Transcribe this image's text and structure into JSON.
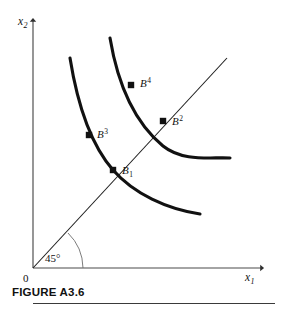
{
  "figure": {
    "caption": "FIGURE A3.6",
    "background_color": "#ffffff",
    "ink_color": "#111111"
  },
  "axes": {
    "y_label_base": "x",
    "y_label_sub": "2",
    "x_label_base": "x",
    "x_label_sub": "1",
    "origin_label": "0",
    "angle_label": "45°",
    "x_axis": {
      "x1": 33,
      "y1": 268,
      "x2": 262,
      "y2": 268
    },
    "y_axis": {
      "x1": 33,
      "y1": 268,
      "x2": 33,
      "y2": 20
    }
  },
  "ray45": {
    "name": "45-degree-ray",
    "x1": 33,
    "y1": 268,
    "x2": 227,
    "y2": 58,
    "angle_degrees": 45
  },
  "curves": [
    {
      "name": "lower-indifference-curve",
      "path": "M 70,58 C 78,108 92,146 113,170 C 134,194 167,209 200,214",
      "stroke_width": 3.1
    },
    {
      "name": "upper-indifference-curve",
      "path": "M 110,38 C 118,86 134,122 163,146 C 183,162 210,157 230,158",
      "stroke_width": 3.1
    }
  ],
  "points": [
    {
      "name": "point-B1",
      "label_base": "B",
      "label_script": "1",
      "script_type": "sub",
      "cx": 113,
      "cy": 170,
      "label_x": 122,
      "label_y": 174
    },
    {
      "name": "point-B2",
      "label_base": "B",
      "label_script": "2",
      "script_type": "sup",
      "cx": 163,
      "cy": 121,
      "label_x": 172,
      "label_y": 125
    },
    {
      "name": "point-B3",
      "label_base": "B",
      "label_script": "3",
      "script_type": "sup",
      "cx": 89,
      "cy": 135,
      "label_x": 97,
      "label_y": 138
    },
    {
      "name": "point-B4",
      "label_base": "B",
      "label_script": "4",
      "script_type": "sup",
      "cx": 131,
      "cy": 85,
      "label_x": 140,
      "label_y": 87
    }
  ],
  "chart_data": {
    "type": "line",
    "title": "FIGURE A3.6",
    "xlabel": "x1",
    "ylabel": "x2",
    "grid": false,
    "legend": "none",
    "annotations": [
      "45°",
      "0",
      "B1",
      "B2",
      "B3",
      "B4"
    ],
    "series": [
      {
        "name": "lower-indifference-curve",
        "description": "convex-to-origin indifference curve through B1 and B3",
        "points_on_curve": [
          "B3",
          "B1"
        ]
      },
      {
        "name": "upper-indifference-curve",
        "description": "convex-to-origin indifference curve through B4 and B2, lying farther from origin",
        "points_on_curve": [
          "B4",
          "B2"
        ]
      },
      {
        "name": "45-degree-ray",
        "description": "ray from origin at 45 degrees, crossing both curves at B1 and B2"
      }
    ]
  }
}
